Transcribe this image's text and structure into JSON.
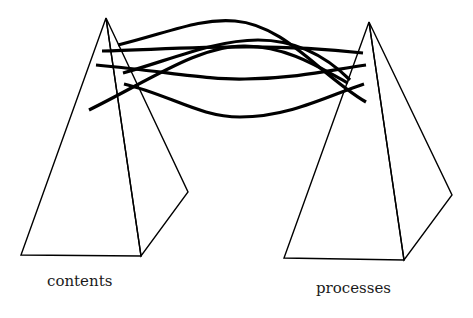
{
  "diagram": {
    "left_pyramid": {
      "label": "contents"
    },
    "right_pyramid": {
      "label": "processes"
    },
    "connectors": {
      "count": 6,
      "description": "curved strands linking the apex regions of the two pyramids"
    },
    "colors": {
      "stroke": "#000000",
      "background": "#ffffff"
    }
  }
}
